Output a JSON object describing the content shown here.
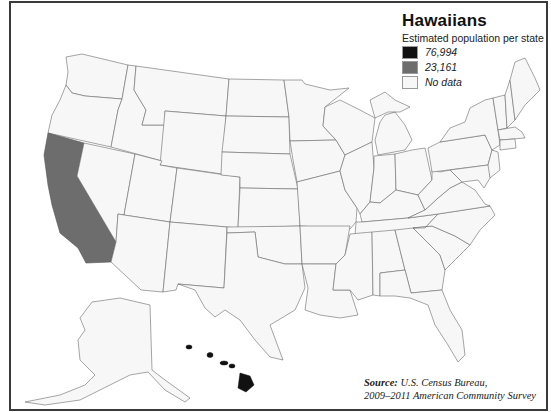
{
  "legend": {
    "title": "Hawaiians",
    "subtitle": "Estimated population per state",
    "items": [
      {
        "label": "76,994",
        "color": "#111111",
        "state": "Hawaii"
      },
      {
        "label": "23,161",
        "color": "#6d6d6d",
        "state": "California"
      },
      {
        "label": "No data",
        "color": "#f7f7f7"
      }
    ]
  },
  "source": {
    "label": "Source:",
    "line1": "U.S. Census Bureau,",
    "line2": "2009–2011 American Community Survey"
  },
  "map": {
    "region": "United States",
    "highlighted_states": [
      {
        "name": "Hawaii",
        "value": "76,994"
      },
      {
        "name": "California",
        "value": "23,161"
      }
    ]
  }
}
